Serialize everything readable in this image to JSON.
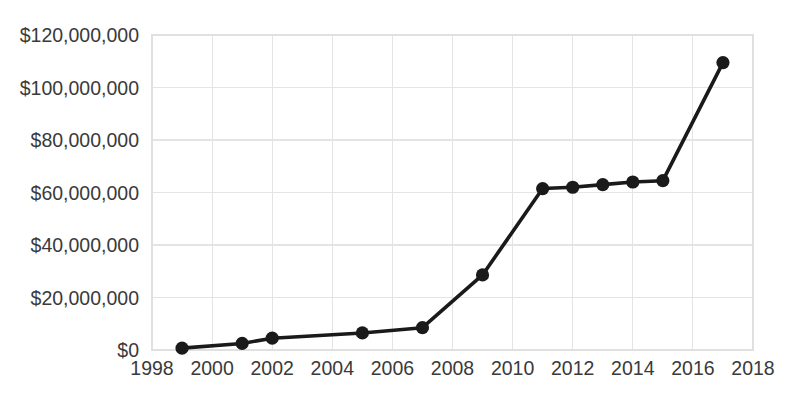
{
  "chart_data": {
    "type": "line",
    "title": "",
    "subtitle": "",
    "xlabel": "",
    "ylabel": "",
    "xlim": [
      1998,
      2018
    ],
    "ylim": [
      0,
      120000000
    ],
    "grid": true,
    "legend": false,
    "legend_position": "none",
    "series": [
      {
        "name": "",
        "marker": "circle",
        "color": "#1a1a1a",
        "points": [
          {
            "x": 1999,
            "y": 700000
          },
          {
            "x": 2001,
            "y": 2500000
          },
          {
            "x": 2002,
            "y": 4500000
          },
          {
            "x": 2005,
            "y": 6500000
          },
          {
            "x": 2007,
            "y": 8500000
          },
          {
            "x": 2009,
            "y": 28600000
          },
          {
            "x": 2011,
            "y": 61500000
          },
          {
            "x": 2012,
            "y": 62000000
          },
          {
            "x": 2013,
            "y": 63000000
          },
          {
            "x": 2014,
            "y": 64000000
          },
          {
            "x": 2015,
            "y": 64500000
          },
          {
            "x": 2017,
            "y": 109500000
          }
        ]
      }
    ],
    "y_ticks": [
      0,
      20000000,
      40000000,
      60000000,
      80000000,
      100000000,
      120000000
    ],
    "y_tick_labels": [
      "$0",
      "$20,000,000",
      "$40,000,000",
      "$60,000,000",
      "$80,000,000",
      "$100,000,000",
      "$120,000,000"
    ],
    "x_ticks": [
      1998,
      2000,
      2002,
      2004,
      2006,
      2008,
      2010,
      2012,
      2014,
      2016,
      2018
    ],
    "x_tick_labels": [
      "1998",
      "2000",
      "2002",
      "2004",
      "2006",
      "2008",
      "2010",
      "2012",
      "2014",
      "2016",
      "2018"
    ]
  },
  "style": {
    "background": "#ffffff",
    "gridline_color": "#e4e4e4",
    "border_color": "#e0e0e0",
    "series_color": "#1a1a1a",
    "tick_label_color": "#3a3a3a"
  },
  "geometry": {
    "plot_left": 152,
    "plot_right": 753,
    "plot_top": 35,
    "plot_bottom": 350
  }
}
